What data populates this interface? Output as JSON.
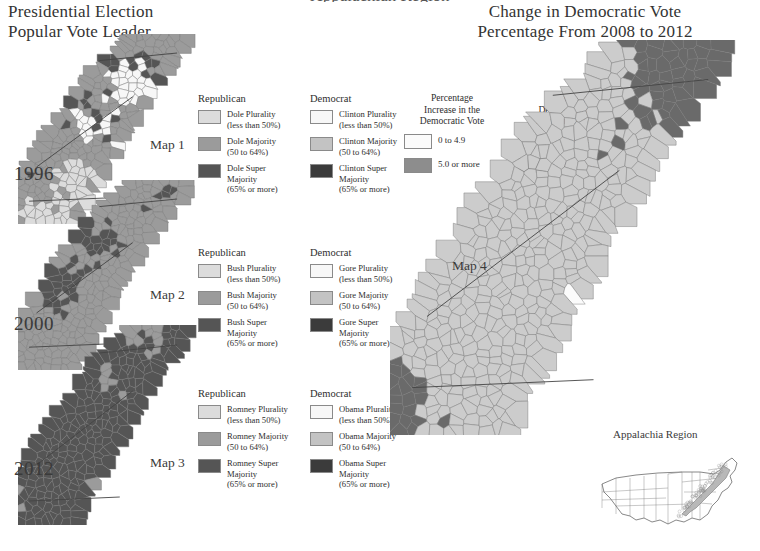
{
  "page": {
    "cut_off_header": "Appalachian Region",
    "bg": "#ffffff"
  },
  "left_panel": {
    "title_line1": "Presidential Election",
    "title_line2": "Popular Vote Leader",
    "maps": [
      {
        "year": "1996",
        "map_label": "Map 1",
        "legend": {
          "left_header": "Republican",
          "right_header": "Democrat",
          "left_items": [
            {
              "label_line1": "Dole Plurality",
              "label_line2": "(less than 50%)",
              "color": "#dcdcdc"
            },
            {
              "label_line1": "Dole Majority",
              "label_line2": "(50 to 64%)",
              "color": "#9b9b9b"
            },
            {
              "label_line1": "Dole Super",
              "label_line2": "Majority",
              "label_line3": "(65% or more)",
              "color": "#555555"
            }
          ],
          "right_items": [
            {
              "label_line1": "Clinton Plurality",
              "label_line2": "(less than 50%)",
              "color": "#f7f7f7"
            },
            {
              "label_line1": "Clinton Majority",
              "label_line2": "(50 to 64%)",
              "color": "#c3c3c3"
            },
            {
              "label_line1": "Clinton Super",
              "label_line2": "Majority",
              "label_line3": "(65% or more)",
              "color": "#3b3b3b"
            }
          ]
        }
      },
      {
        "year": "2000",
        "map_label": "Map 2",
        "legend": {
          "left_header": "Republican",
          "right_header": "Democrat",
          "left_items": [
            {
              "label_line1": "Bush Plurality",
              "label_line2": "(less than 50%)",
              "color": "#dcdcdc"
            },
            {
              "label_line1": "Bush Majority",
              "label_line2": "(50 to 64%)",
              "color": "#9b9b9b"
            },
            {
              "label_line1": "Bush Super",
              "label_line2": "Majority",
              "label_line3": "(65% or more)",
              "color": "#555555"
            }
          ],
          "right_items": [
            {
              "label_line1": "Gore Plurality",
              "label_line2": "(less than 50%)",
              "color": "#f7f7f7"
            },
            {
              "label_line1": "Gore Majority",
              "label_line2": "(50 to 64%)",
              "color": "#c3c3c3"
            },
            {
              "label_line1": "Gore Super",
              "label_line2": "Majority",
              "label_line3": "(65% or more)",
              "color": "#3b3b3b"
            }
          ]
        }
      },
      {
        "year": "2012",
        "map_label": "Map 3",
        "legend": {
          "left_header": "Republican",
          "right_header": "Democrat",
          "left_items": [
            {
              "label_line1": "Romney Plurality",
              "label_line2": "(less than 50%)",
              "color": "#dcdcdc"
            },
            {
              "label_line1": "Romney Majority",
              "label_line2": "(50 to 64%)",
              "color": "#9b9b9b"
            },
            {
              "label_line1": "Romney Super",
              "label_line2": "Majority",
              "label_line3": "(65% or more)",
              "color": "#555555"
            }
          ],
          "right_items": [
            {
              "label_line1": "Obama Plurality",
              "label_line2": "(less than 50%)",
              "color": "#f7f7f7"
            },
            {
              "label_line1": "Obama Majority",
              "label_line2": "(50 to 64%)",
              "color": "#c3c3c3"
            },
            {
              "label_line1": "Obama Super",
              "label_line2": "Majority",
              "label_line3": "(65% or more)",
              "color": "#3b3b3b"
            }
          ]
        }
      }
    ]
  },
  "right_panel": {
    "title_line1": "Change in Democratic Vote",
    "title_line2": "Percentage From 2008 to 2012",
    "map_label": "Map 4",
    "legend": {
      "increase_header_line1": "Percentage",
      "increase_header_line2": "Increase in the",
      "increase_header_line3": "Democratic Vote",
      "decrease_header_line1": "Percentage",
      "decrease_header_line2": "Decrease in the",
      "decrease_header_line3": "Democratic Vote",
      "increase_items": [
        {
          "label": "0 to 4.9",
          "color": "#fbfbfb"
        },
        {
          "label": "5.0 or more",
          "color": "#8d8d8d"
        }
      ],
      "decrease_items": [
        {
          "label": "-0.1 to -4.9",
          "color": "#cccccc"
        },
        {
          "label": "-5.0 or more",
          "color": "#6a6a6a"
        }
      ]
    },
    "inset": {
      "title": "Appalachia Region"
    }
  },
  "chart_data": {
    "type": "map",
    "subtype": "choropleth-county",
    "region": "Appalachia Region",
    "panels": [
      {
        "id": "Map 1",
        "year": "1996",
        "variable": "Presidential popular vote leader by county",
        "classes": [
          {
            "name": "Dole Plurality (less than 50%)",
            "color": "#dcdcdc",
            "share": 0.3
          },
          {
            "name": "Dole Majority (50 to 64%)",
            "color": "#9b9b9b",
            "share": 0.33
          },
          {
            "name": "Dole Super Majority (65% or more)",
            "color": "#555555",
            "share": 0.05
          },
          {
            "name": "Clinton Plurality (less than 50%)",
            "color": "#f7f7f7",
            "share": 0.17
          },
          {
            "name": "Clinton Majority (50 to 64%)",
            "color": "#c3c3c3",
            "share": 0.14
          },
          {
            "name": "Clinton Super Majority (65% or more)",
            "color": "#3b3b3b",
            "share": 0.01
          }
        ]
      },
      {
        "id": "Map 2",
        "year": "2000",
        "variable": "Presidential popular vote leader by county",
        "classes": [
          {
            "name": "Bush Plurality (less than 50%)",
            "color": "#dcdcdc",
            "share": 0.13
          },
          {
            "name": "Bush Majority (50 to 64%)",
            "color": "#9b9b9b",
            "share": 0.52
          },
          {
            "name": "Bush Super Majority (65% or more)",
            "color": "#555555",
            "share": 0.18
          },
          {
            "name": "Gore Plurality (less than 50%)",
            "color": "#f7f7f7",
            "share": 0.05
          },
          {
            "name": "Gore Majority (50 to 64%)",
            "color": "#c3c3c3",
            "share": 0.11
          },
          {
            "name": "Gore Super Majority (65% or more)",
            "color": "#3b3b3b",
            "share": 0.01
          }
        ]
      },
      {
        "id": "Map 3",
        "year": "2012",
        "variable": "Presidential popular vote leader by county",
        "classes": [
          {
            "name": "Romney Plurality (less than 50%)",
            "color": "#dcdcdc",
            "share": 0.04
          },
          {
            "name": "Romney Majority (50 to 64%)",
            "color": "#9b9b9b",
            "share": 0.28
          },
          {
            "name": "Romney Super Majority (65% or more)",
            "color": "#555555",
            "share": 0.6
          },
          {
            "name": "Obama Plurality (less than 50%)",
            "color": "#f7f7f7",
            "share": 0.02
          },
          {
            "name": "Obama Majority (50 to 64%)",
            "color": "#c3c3c3",
            "share": 0.05
          },
          {
            "name": "Obama Super Majority (65% or more)",
            "color": "#3b3b3b",
            "share": 0.01
          }
        ]
      },
      {
        "id": "Map 4",
        "year": "2008 to 2012",
        "variable": "Change in Democratic vote percentage",
        "classes": [
          {
            "name": "Increase 0 to 4.9",
            "color": "#fbfbfb",
            "share": 0.1
          },
          {
            "name": "Increase 5.0 or more",
            "color": "#8d8d8d",
            "share": 0.02
          },
          {
            "name": "Decrease -0.1 to -4.9",
            "color": "#cccccc",
            "share": 0.55
          },
          {
            "name": "Decrease -5.0 or more",
            "color": "#6a6a6a",
            "share": 0.33
          }
        ]
      }
    ]
  }
}
